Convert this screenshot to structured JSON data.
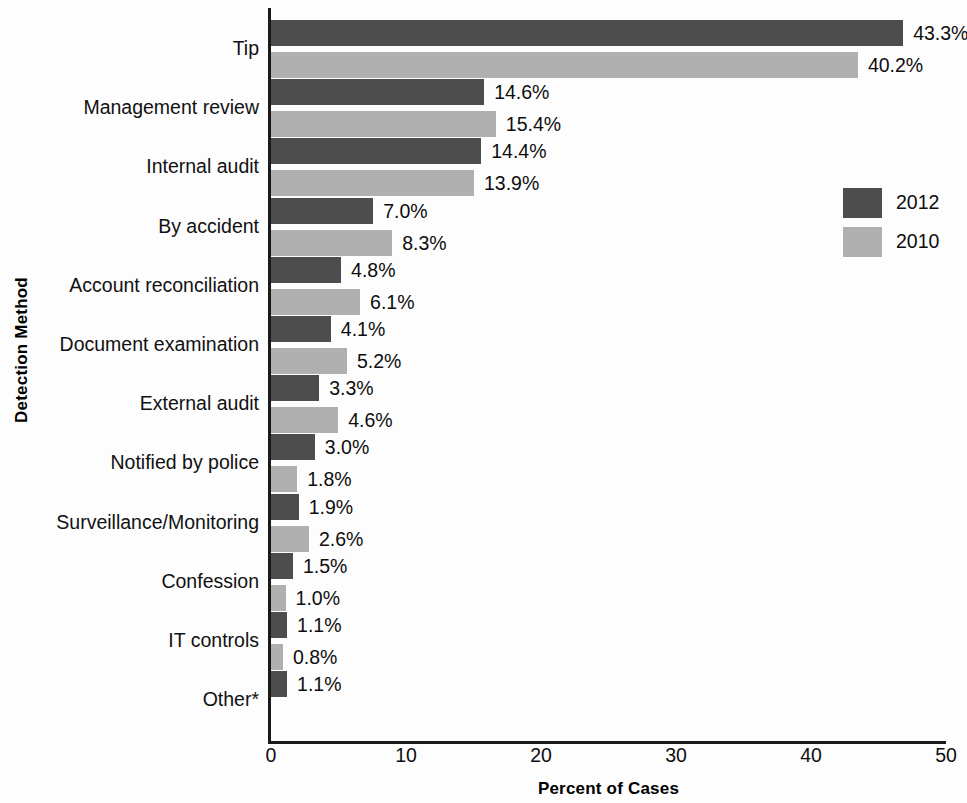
{
  "chart_data": {
    "type": "bar",
    "orientation": "horizontal",
    "title": "",
    "xlabel": "Percent of Cases",
    "ylabel": "Detection Method",
    "xlim": [
      0,
      50
    ],
    "xticks": [
      "0",
      "10",
      "20",
      "30",
      "40",
      "50"
    ],
    "grid": false,
    "legend_position": "right",
    "categories": [
      "Tip",
      "Management review",
      "Internal audit",
      "By accident",
      "Account reconciliation",
      "Document examination",
      "External audit",
      "Notified by police",
      "Surveillance/Monitoring",
      "Confession",
      "IT controls",
      "Other*"
    ],
    "series": [
      {
        "name": "2012",
        "color": "#4d4d4d",
        "values": [
          43.3,
          14.6,
          14.4,
          7.0,
          4.8,
          4.1,
          3.3,
          3.0,
          1.9,
          1.5,
          1.1,
          1.1
        ],
        "labels": [
          "43.3%",
          "14.6%",
          "14.4%",
          "7.0%",
          "4.8%",
          "4.1%",
          "3.3%",
          "3.0%",
          "1.9%",
          "1.5%",
          "1.1%",
          "1.1%"
        ]
      },
      {
        "name": "2010",
        "color": "#b0b0b0",
        "values": [
          40.2,
          15.4,
          13.9,
          8.3,
          6.1,
          5.2,
          4.6,
          1.8,
          2.6,
          1.0,
          0.8,
          null
        ],
        "labels": [
          "40.2%",
          "15.4%",
          "13.9%",
          "8.3%",
          "6.1%",
          "5.2%",
          "4.6%",
          "1.8%",
          "2.6%",
          "1.0%",
          "0.8%",
          ""
        ]
      }
    ]
  },
  "legend": {
    "items": [
      {
        "label": "2012",
        "color": "#4d4d4d"
      },
      {
        "label": "2010",
        "color": "#b0b0b0"
      }
    ]
  }
}
